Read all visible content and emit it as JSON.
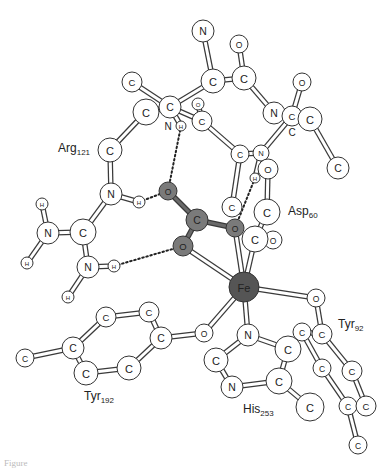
{
  "figure": {
    "caption_partial": "Figure",
    "colors": {
      "atom_fill": "#ffffff",
      "ligand_fill": "#7a7a7a",
      "metal_fill": "#555555",
      "outline": "#333333"
    }
  },
  "residue_labels": [
    {
      "id": "arg",
      "name": "Arg",
      "number": "121",
      "x": 58,
      "y": 152
    },
    {
      "id": "asp",
      "name": "Asp",
      "number": "60",
      "x": 288,
      "y": 215
    },
    {
      "id": "tyr92",
      "name": "Tyr",
      "number": "92",
      "x": 338,
      "y": 328
    },
    {
      "id": "tyr192",
      "name": "Tyr",
      "number": "192",
      "x": 84,
      "y": 400
    },
    {
      "id": "his",
      "name": "His",
      "number": "253",
      "x": 243,
      "y": 413
    }
  ],
  "atoms": [
    {
      "id": "a1",
      "el": "N",
      "x": 203,
      "y": 31,
      "r": 11,
      "type": "normal"
    },
    {
      "id": "a2",
      "el": "O",
      "x": 239,
      "y": 44,
      "r": 9,
      "type": "normal"
    },
    {
      "id": "a3",
      "el": "C",
      "x": 213,
      "y": 81,
      "r": 12,
      "type": "normal"
    },
    {
      "id": "a4",
      "el": "C",
      "x": 244,
      "y": 78,
      "r": 12,
      "type": "normal"
    },
    {
      "id": "a5",
      "el": "C",
      "x": 132,
      "y": 82,
      "r": 10,
      "type": "normal"
    },
    {
      "id": "a6",
      "el": "O",
      "x": 302,
      "y": 82,
      "r": 9,
      "type": "normal"
    },
    {
      "id": "a7",
      "el": "C",
      "x": 146,
      "y": 112,
      "r": 13,
      "type": "normal"
    },
    {
      "id": "a8",
      "el": "C",
      "x": 170,
      "y": 107,
      "r": 11,
      "type": "normal"
    },
    {
      "id": "a9",
      "el": "O",
      "x": 198,
      "y": 104,
      "r": 6,
      "type": "normal"
    },
    {
      "id": "a10",
      "el": "C",
      "x": 202,
      "y": 121,
      "r": 10,
      "type": "normal"
    },
    {
      "id": "a11",
      "el": "H",
      "x": 181,
      "y": 126,
      "r": 5,
      "type": "normal"
    },
    {
      "id": "a12",
      "el": "N",
      "x": 274,
      "y": 113,
      "r": 11,
      "type": "normal"
    },
    {
      "id": "a13",
      "el": "C",
      "x": 292,
      "y": 116,
      "r": 10,
      "type": "normal"
    },
    {
      "id": "a14",
      "el": "C",
      "x": 310,
      "y": 119,
      "r": 12,
      "type": "normal"
    },
    {
      "id": "a15",
      "el": "C",
      "x": 110,
      "y": 150,
      "r": 12,
      "type": "normal"
    },
    {
      "id": "a16",
      "el": "C",
      "x": 240,
      "y": 154,
      "r": 9,
      "type": "normal"
    },
    {
      "id": "a17",
      "el": "N",
      "x": 261,
      "y": 153,
      "r": 8,
      "type": "normal"
    },
    {
      "id": "a18",
      "el": "C",
      "x": 338,
      "y": 168,
      "r": 11,
      "type": "normal"
    },
    {
      "id": "a19",
      "el": "O",
      "x": 268,
      "y": 169,
      "r": 10,
      "type": "normal"
    },
    {
      "id": "a20",
      "el": "H",
      "x": 255,
      "y": 178,
      "r": 5,
      "type": "normal"
    },
    {
      "id": "a21",
      "el": "O",
      "x": 168,
      "y": 191,
      "r": 9,
      "type": "ligand"
    },
    {
      "id": "a22",
      "el": "N",
      "x": 111,
      "y": 194,
      "r": 11,
      "type": "normal"
    },
    {
      "id": "a23",
      "el": "H",
      "x": 139,
      "y": 202,
      "r": 6,
      "type": "normal"
    },
    {
      "id": "a24",
      "el": "H",
      "x": 42,
      "y": 204,
      "r": 6,
      "type": "normal"
    },
    {
      "id": "a25",
      "el": "C",
      "x": 232,
      "y": 207,
      "r": 10,
      "type": "normal"
    },
    {
      "id": "a26",
      "el": "C",
      "x": 267,
      "y": 212,
      "r": 13,
      "type": "normal"
    },
    {
      "id": "a27",
      "el": "C",
      "x": 197,
      "y": 220,
      "r": 11,
      "type": "ligand"
    },
    {
      "id": "a28",
      "el": "O",
      "x": 235,
      "y": 228,
      "r": 9,
      "type": "ligand"
    },
    {
      "id": "a29",
      "el": "N",
      "x": 48,
      "y": 233,
      "r": 11,
      "type": "normal"
    },
    {
      "id": "a30",
      "el": "C",
      "x": 83,
      "y": 232,
      "r": 13,
      "type": "normal"
    },
    {
      "id": "a31",
      "el": "O",
      "x": 273,
      "y": 240,
      "r": 9,
      "type": "normal"
    },
    {
      "id": "a32",
      "el": "C",
      "x": 255,
      "y": 239,
      "r": 13,
      "type": "normal"
    },
    {
      "id": "a33",
      "el": "O",
      "x": 183,
      "y": 246,
      "r": 10,
      "type": "ligand"
    },
    {
      "id": "a34",
      "el": "H",
      "x": 27,
      "y": 263,
      "r": 6,
      "type": "normal"
    },
    {
      "id": "a35",
      "el": "H",
      "x": 114,
      "y": 266,
      "r": 6,
      "type": "normal"
    },
    {
      "id": "a36",
      "el": "N",
      "x": 88,
      "y": 267,
      "r": 11,
      "type": "normal"
    },
    {
      "id": "a37",
      "el": "Fe",
      "x": 244,
      "y": 287,
      "r": 15,
      "type": "metal"
    },
    {
      "id": "a38",
      "el": "H",
      "x": 68,
      "y": 297,
      "r": 6,
      "type": "normal"
    },
    {
      "id": "a39",
      "el": "O",
      "x": 316,
      "y": 298,
      "r": 9,
      "type": "normal"
    },
    {
      "id": "a40",
      "el": "C",
      "x": 149,
      "y": 312,
      "r": 10,
      "type": "normal"
    },
    {
      "id": "a41",
      "el": "C",
      "x": 106,
      "y": 317,
      "r": 10,
      "type": "normal"
    },
    {
      "id": "a42",
      "el": "C",
      "x": 302,
      "y": 332,
      "r": 9,
      "type": "normal"
    },
    {
      "id": "a43",
      "el": "C",
      "x": 322,
      "y": 334,
      "r": 10,
      "type": "normal"
    },
    {
      "id": "a44",
      "el": "O",
      "x": 204,
      "y": 333,
      "r": 9,
      "type": "normal"
    },
    {
      "id": "a45",
      "el": "N",
      "x": 248,
      "y": 335,
      "r": 11,
      "type": "normal"
    },
    {
      "id": "a46",
      "el": "C",
      "x": 161,
      "y": 338,
      "r": 11,
      "type": "normal"
    },
    {
      "id": "a47",
      "el": "C",
      "x": 73,
      "y": 348,
      "r": 11,
      "type": "normal"
    },
    {
      "id": "a48",
      "el": "C",
      "x": 288,
      "y": 349,
      "r": 13,
      "type": "normal"
    },
    {
      "id": "a49",
      "el": "C",
      "x": 25,
      "y": 358,
      "r": 9,
      "type": "normal"
    },
    {
      "id": "a50",
      "el": "C",
      "x": 216,
      "y": 360,
      "r": 12,
      "type": "normal"
    },
    {
      "id": "a51",
      "el": "C",
      "x": 322,
      "y": 368,
      "r": 9,
      "type": "normal"
    },
    {
      "id": "a52",
      "el": "C",
      "x": 129,
      "y": 368,
      "r": 12,
      "type": "normal"
    },
    {
      "id": "a53",
      "el": "C",
      "x": 352,
      "y": 371,
      "r": 10,
      "type": "normal"
    },
    {
      "id": "a54",
      "el": "C",
      "x": 86,
      "y": 373,
      "r": 12,
      "type": "normal"
    },
    {
      "id": "a55",
      "el": "C",
      "x": 279,
      "y": 381,
      "r": 13,
      "type": "normal"
    },
    {
      "id": "a56",
      "el": "N",
      "x": 232,
      "y": 387,
      "r": 11,
      "type": "normal"
    },
    {
      "id": "a57",
      "el": "C",
      "x": 348,
      "y": 406,
      "r": 9,
      "type": "normal"
    },
    {
      "id": "a58",
      "el": "C",
      "x": 366,
      "y": 406,
      "r": 10,
      "type": "normal"
    },
    {
      "id": "a59",
      "el": "C",
      "x": 310,
      "y": 407,
      "r": 14,
      "type": "normal"
    },
    {
      "id": "a60",
      "el": "C",
      "x": 358,
      "y": 445,
      "r": 9,
      "type": "normal"
    },
    {
      "id": "a61",
      "el": "H",
      "x": 168,
      "y": 126,
      "r": 0,
      "type": "text",
      "label": "N"
    },
    {
      "id": "a62",
      "el": "C",
      "x": 292,
      "y": 132,
      "r": 0,
      "type": "text",
      "label": "C"
    }
  ],
  "bonds": [
    [
      "a1",
      "a3",
      "normal"
    ],
    [
      "a2",
      "a4",
      "normal"
    ],
    [
      "a3",
      "a4",
      "normal"
    ],
    [
      "a3",
      "a8",
      "normal"
    ],
    [
      "a5",
      "a8",
      "normal"
    ],
    [
      "a7",
      "a8",
      "normal"
    ],
    [
      "a7",
      "a15",
      "normal"
    ],
    [
      "a8",
      "a10",
      "normal"
    ],
    [
      "a9",
      "a10",
      "normal"
    ],
    [
      "a8",
      "a11",
      "normal"
    ],
    [
      "a4",
      "a12",
      "normal"
    ],
    [
      "a12",
      "a13",
      "normal"
    ],
    [
      "a13",
      "a14",
      "normal"
    ],
    [
      "a6",
      "a13",
      "normal"
    ],
    [
      "a14",
      "a18",
      "normal"
    ],
    [
      "a13",
      "a17",
      "normal"
    ],
    [
      "a10",
      "a16",
      "normal"
    ],
    [
      "a16",
      "a17",
      "normal"
    ],
    [
      "a16",
      "a25",
      "normal"
    ],
    [
      "a17",
      "a20",
      "normal"
    ],
    [
      "a19",
      "a26",
      "normal"
    ],
    [
      "a26",
      "a32",
      "normal"
    ],
    [
      "a31",
      "a32",
      "normal"
    ],
    [
      "a15",
      "a22",
      "normal"
    ],
    [
      "a22",
      "a23",
      "normal"
    ],
    [
      "a22",
      "a30",
      "normal"
    ],
    [
      "a29",
      "a30",
      "normal"
    ],
    [
      "a29",
      "a24",
      "normal"
    ],
    [
      "a29",
      "a34",
      "normal"
    ],
    [
      "a30",
      "a36",
      "normal"
    ],
    [
      "a36",
      "a35",
      "normal"
    ],
    [
      "a36",
      "a38",
      "normal"
    ],
    [
      "a21",
      "a27",
      "ligand"
    ],
    [
      "a27",
      "a28",
      "ligand"
    ],
    [
      "a27",
      "a33",
      "ligand"
    ],
    [
      "a33",
      "a37",
      "normal"
    ],
    [
      "a28",
      "a37",
      "normal"
    ],
    [
      "a32",
      "a37",
      "normal"
    ],
    [
      "a37",
      "a39",
      "normal"
    ],
    [
      "a37",
      "a44",
      "normal"
    ],
    [
      "a37",
      "a45",
      "normal"
    ],
    [
      "a44",
      "a46",
      "normal"
    ],
    [
      "a46",
      "a40",
      "normal"
    ],
    [
      "a40",
      "a41",
      "normal"
    ],
    [
      "a41",
      "a47",
      "normal"
    ],
    [
      "a47",
      "a54",
      "normal"
    ],
    [
      "a54",
      "a52",
      "normal"
    ],
    [
      "a52",
      "a46",
      "normal"
    ],
    [
      "a47",
      "a49",
      "normal"
    ],
    [
      "a45",
      "a48",
      "normal"
    ],
    [
      "a45",
      "a50",
      "normal"
    ],
    [
      "a50",
      "a56",
      "normal"
    ],
    [
      "a56",
      "a55",
      "normal"
    ],
    [
      "a55",
      "a48",
      "normal"
    ],
    [
      "a55",
      "a59",
      "normal"
    ],
    [
      "a39",
      "a43",
      "normal"
    ],
    [
      "a42",
      "a43",
      "normal"
    ],
    [
      "a42",
      "a51",
      "normal"
    ],
    [
      "a43",
      "a53",
      "normal"
    ],
    [
      "a51",
      "a57",
      "normal"
    ],
    [
      "a53",
      "a58",
      "normal"
    ],
    [
      "a57",
      "a58",
      "normal"
    ],
    [
      "a57",
      "a60",
      "normal"
    ]
  ],
  "hbonds": [
    [
      "a11",
      "a21"
    ],
    [
      "a23",
      "a21"
    ],
    [
      "a35",
      "a33"
    ],
    [
      "a20",
      "a28"
    ]
  ]
}
